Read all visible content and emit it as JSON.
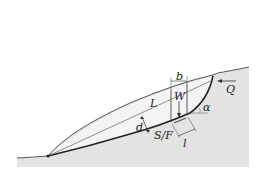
{
  "diagram": {
    "labels": {
      "b": "b",
      "W": "W",
      "Q": "Q",
      "L": "L",
      "alpha": "α",
      "d": "d",
      "SF": "S/F",
      "l": "l"
    },
    "colors": {
      "ground": "#e3e3e3",
      "sliding_mass": "#f3f3f3",
      "line": "#333333",
      "slip_surface": "#222222"
    }
  }
}
